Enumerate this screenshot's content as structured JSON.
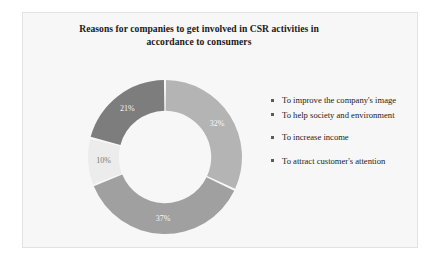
{
  "figure": {
    "background_color": "#f7f7f7",
    "border_color": "#e3e3e3"
  },
  "title": {
    "line1": "Reasons for companies to get involved in CSR activities in",
    "line2": "accordance to consumers"
  },
  "chart_data": {
    "type": "pie",
    "variant": "donut",
    "title": "Reasons for companies to get involved in CSR activities in accordance to consumers",
    "xlabel": "",
    "ylabel": "",
    "legend_position": "right",
    "grid": false,
    "units": "percent",
    "total": 100,
    "start_angle_deg": 0,
    "direction": "clockwise",
    "inner_radius_ratio": 0.6,
    "categories": [
      "To improve the company's image",
      "To help society and environment",
      "To increase income",
      "To attract customer's attention"
    ],
    "values": [
      32,
      37,
      10,
      21
    ],
    "labels": [
      "32%",
      "37%",
      "10%",
      "21%"
    ],
    "colors": [
      "#b4b4b4",
      "#a0a0a0",
      "#ececec",
      "#7d7d7d"
    ],
    "slices": [
      {
        "name": "To improve the company's image",
        "value": 32,
        "label": "32%",
        "color": "#b4b4b4"
      },
      {
        "name": "To help society and environment",
        "value": 37,
        "label": "37%",
        "color": "#a0a0a0"
      },
      {
        "name": "To increase income",
        "value": 10,
        "label": "10%",
        "color": "#ececec"
      },
      {
        "name": "To attract customer's attention",
        "value": 21,
        "label": "21%",
        "color": "#7d7d7d"
      }
    ]
  },
  "legend": {
    "marker_color": "#5a5a5a",
    "items": [
      {
        "label": "To improve the company's image"
      },
      {
        "label": "To help society and environment"
      },
      {
        "label": "To increase income"
      },
      {
        "label": "To attract customer's attention"
      }
    ]
  }
}
